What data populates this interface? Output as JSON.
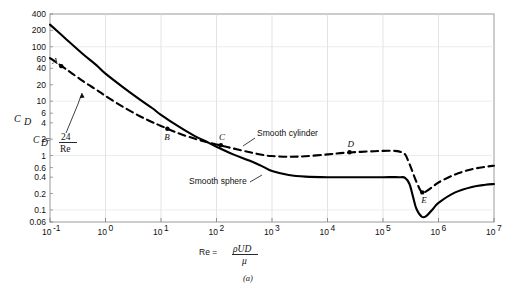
{
  "chart_data": {
    "type": "line",
    "title": "",
    "caption": "(a)",
    "xlabel_prefix": "Re  = ",
    "xlabel_numerator": "ρUD",
    "xlabel_denominator": "μ",
    "ylabel": "C",
    "ylabel_sub": "D",
    "xscale": "log",
    "yscale": "log",
    "xlim": [
      0.1,
      10000000
    ],
    "ylim": [
      0.06,
      400
    ],
    "grid": true,
    "legend_position": "inline-annotations",
    "xticks": [
      {
        "value": 0.1,
        "mantissa": "10",
        "exponent": "-1"
      },
      {
        "value": 1,
        "mantissa": "10",
        "exponent": "0"
      },
      {
        "value": 10,
        "mantissa": "10",
        "exponent": "1"
      },
      {
        "value": 100,
        "mantissa": "10",
        "exponent": "2"
      },
      {
        "value": 1000,
        "mantissa": "10",
        "exponent": "3"
      },
      {
        "value": 10000,
        "mantissa": "10",
        "exponent": "4"
      },
      {
        "value": 100000,
        "mantissa": "10",
        "exponent": "5"
      },
      {
        "value": 1000000,
        "mantissa": "10",
        "exponent": "6"
      },
      {
        "value": 10000000,
        "mantissa": "10",
        "exponent": "7"
      }
    ],
    "yticks": [
      {
        "value": 400,
        "label": "400"
      },
      {
        "value": 200,
        "label": "200"
      },
      {
        "value": 100,
        "label": "100"
      },
      {
        "value": 60,
        "label": "60"
      },
      {
        "value": 40,
        "label": "40"
      },
      {
        "value": 20,
        "label": "20"
      },
      {
        "value": 10,
        "label": "10"
      },
      {
        "value": 6,
        "label": "6"
      },
      {
        "value": 4,
        "label": "4"
      },
      {
        "value": 2,
        "label": "2"
      },
      {
        "value": 1,
        "label": "1"
      },
      {
        "value": 0.6,
        "label": "0.6"
      },
      {
        "value": 0.4,
        "label": "0.4"
      },
      {
        "value": 0.2,
        "label": "0.2"
      },
      {
        "value": 0.1,
        "label": "0.1"
      },
      {
        "value": 0.06,
        "label": "0.06"
      }
    ],
    "series": [
      {
        "name": "Smooth sphere",
        "style": "solid",
        "color": "#000000",
        "label": "Smooth sphere",
        "points": [
          [
            0.1,
            255
          ],
          [
            0.2,
            135
          ],
          [
            0.4,
            72
          ],
          [
            0.7,
            45
          ],
          [
            1,
            32
          ],
          [
            2,
            18.5
          ],
          [
            4,
            11
          ],
          [
            7,
            7.4
          ],
          [
            10,
            5.6
          ],
          [
            20,
            3.5
          ],
          [
            40,
            2.3
          ],
          [
            70,
            1.75
          ],
          [
            100,
            1.45
          ],
          [
            200,
            1.05
          ],
          [
            400,
            0.8
          ],
          [
            700,
            0.62
          ],
          [
            1000,
            0.52
          ],
          [
            2000,
            0.44
          ],
          [
            4000,
            0.41
          ],
          [
            10000,
            0.4
          ],
          [
            40000,
            0.4
          ],
          [
            100000,
            0.4
          ],
          [
            200000,
            0.4
          ],
          [
            250000,
            0.39
          ],
          [
            300000,
            0.3
          ],
          [
            350000,
            0.17
          ],
          [
            400000,
            0.105
          ],
          [
            500000,
            0.075
          ],
          [
            600000,
            0.077
          ],
          [
            800000,
            0.105
          ],
          [
            1000000,
            0.135
          ],
          [
            2000000,
            0.21
          ],
          [
            4000000,
            0.265
          ],
          [
            7000000,
            0.29
          ],
          [
            10000000,
            0.3
          ]
        ]
      },
      {
        "name": "Smooth cylinder",
        "style": "dashed",
        "color": "#000000",
        "label": "Smooth cylinder",
        "points": [
          [
            0.1,
            62
          ],
          [
            0.2,
            38
          ],
          [
            0.4,
            23
          ],
          [
            0.7,
            16
          ],
          [
            1,
            12.5
          ],
          [
            2,
            8.0
          ],
          [
            4,
            5.4
          ],
          [
            7,
            4.1
          ],
          [
            10,
            3.5
          ],
          [
            20,
            2.6
          ],
          [
            40,
            2.05
          ],
          [
            70,
            1.75
          ],
          [
            100,
            1.6
          ],
          [
            200,
            1.35
          ],
          [
            400,
            1.15
          ],
          [
            700,
            1.02
          ],
          [
            1000,
            0.98
          ],
          [
            2000,
            0.95
          ],
          [
            4000,
            0.97
          ],
          [
            10000,
            1.05
          ],
          [
            20000,
            1.12
          ],
          [
            40000,
            1.17
          ],
          [
            70000,
            1.2
          ],
          [
            100000,
            1.22
          ],
          [
            150000,
            1.22
          ],
          [
            200000,
            1.18
          ],
          [
            250000,
            1.05
          ],
          [
            300000,
            0.7
          ],
          [
            400000,
            0.33
          ],
          [
            500000,
            0.21
          ],
          [
            600000,
            0.22
          ],
          [
            800000,
            0.27
          ],
          [
            1000000,
            0.32
          ],
          [
            2000000,
            0.45
          ],
          [
            4000000,
            0.56
          ],
          [
            7000000,
            0.62
          ],
          [
            10000000,
            0.65
          ]
        ]
      }
    ],
    "annotations": [
      {
        "id": "stokes-law",
        "text_prefix": "C",
        "text_sub": "D",
        "text_eq": " = ",
        "numerator": "24",
        "denominator": "Re",
        "x": 0.45,
        "y": 3.2
      }
    ],
    "markers": [
      {
        "label": "A",
        "series": "Smooth cylinder",
        "x": 0.16,
        "y": 44
      },
      {
        "label": "B",
        "series": "crossover",
        "x": 13,
        "y": 3.1
      },
      {
        "label": "C",
        "series": "Smooth cylinder",
        "x": 120,
        "y": 1.55
      },
      {
        "label": "D",
        "series": "Smooth cylinder",
        "x": 25000,
        "y": 1.15
      },
      {
        "label": "E",
        "series": "Smooth cylinder",
        "x": 510000,
        "y": 0.21
      }
    ]
  }
}
